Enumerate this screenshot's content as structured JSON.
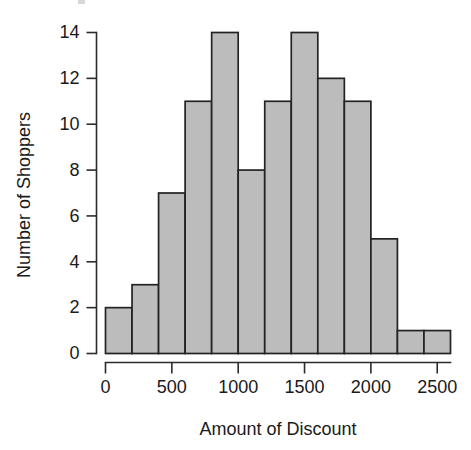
{
  "chart_data": {
    "type": "bar",
    "subtype": "histogram",
    "title": "",
    "xlabel": "Amount of Discount",
    "ylabel": "Number of Shoppers",
    "bin_width": 200,
    "bin_edges": [
      0,
      200,
      400,
      600,
      800,
      1000,
      1200,
      1400,
      1600,
      1800,
      2000,
      2200,
      2400,
      2600
    ],
    "categories": [
      "0-200",
      "200-400",
      "400-600",
      "600-800",
      "800-1000",
      "1000-1200",
      "1200-1400",
      "1400-1600",
      "1600-1800",
      "1800-2000",
      "2000-2200",
      "2200-2400",
      "2400-2600"
    ],
    "values": [
      2,
      3,
      7,
      11,
      14,
      8,
      11,
      14,
      12,
      11,
      5,
      1,
      1
    ],
    "xlim": [
      0,
      2600
    ],
    "ylim": [
      0,
      14
    ],
    "xticks": [
      0,
      500,
      1000,
      1500,
      2000,
      2500
    ],
    "xtick_labels": [
      "0",
      "500",
      "1000",
      "1500",
      "2000",
      "2500"
    ],
    "yticks": [
      0,
      2,
      4,
      6,
      8,
      10,
      12,
      14
    ],
    "ytick_labels": [
      "0",
      "2",
      "4",
      "6",
      "8",
      "10",
      "12",
      "14"
    ],
    "grid": false,
    "legend": false,
    "legend_position": "none",
    "total_count": 100,
    "bar_fill_color": "#bcbcbc",
    "bar_edge_color": "#232323",
    "axis_color": "#2b2b2b",
    "background_color": "#ffffff"
  }
}
